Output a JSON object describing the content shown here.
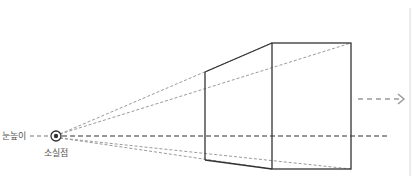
{
  "diagram": {
    "labels": {
      "eye_level": "눈높이",
      "vanishing_point": "소실점"
    },
    "colors": {
      "solid_line": "#333333",
      "dashed_line": "#9a9a9a",
      "horizon_line": "#777777",
      "label_text": "#555555",
      "border": "#d8d8d8"
    },
    "vanishing_point": {
      "x": 56,
      "y": 136
    },
    "box": {
      "back_face": {
        "x": 205,
        "top": 72,
        "bottom": 160
      },
      "front_face": {
        "left": 272,
        "right": 351,
        "top": 43,
        "bottom": 169
      }
    },
    "direction_arrow": {
      "x1": 358,
      "x2": 404,
      "y": 99
    }
  }
}
